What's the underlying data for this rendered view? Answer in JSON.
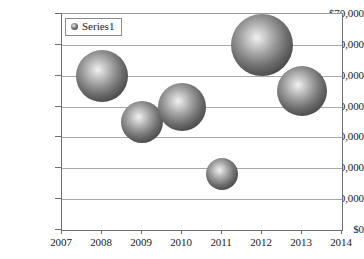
{
  "chart_data": {
    "type": "scatter",
    "subtype": "bubble",
    "title": "",
    "xlabel": "",
    "ylabel": "",
    "xlim": [
      2007,
      2014
    ],
    "ylim": [
      0,
      70000
    ],
    "grid": true,
    "legend_position": "top-left",
    "x_tick_labels": [
      "2007",
      "2008",
      "2009",
      "2010",
      "2011",
      "2012",
      "2013",
      "2014"
    ],
    "x_ticks": [
      2007,
      2008,
      2009,
      2010,
      2011,
      2012,
      2013,
      2014
    ],
    "y_tick_labels": [
      "$0",
      "$10,000",
      "$20,000",
      "$30,000",
      "$40,000",
      "$50,000",
      "$60,000",
      "$70,000"
    ],
    "y_ticks": [
      0,
      10000,
      20000,
      30000,
      40000,
      50000,
      60000,
      70000
    ],
    "series": [
      {
        "name": "Series1",
        "marker_style": "3d-sphere",
        "marker_color": "#4a4a4a",
        "points": [
          {
            "label": "2008",
            "x": 2008,
            "y": 50000,
            "size": 52
          },
          {
            "label": "2009",
            "x": 2009,
            "y": 35000,
            "size": 42
          },
          {
            "label": "2010",
            "x": 2010,
            "y": 40000,
            "size": 48
          },
          {
            "label": "2011",
            "x": 2011,
            "y": 18000,
            "size": 32
          },
          {
            "label": "2012",
            "x": 2012,
            "y": 60000,
            "size": 62
          },
          {
            "label": "2013",
            "x": 2013,
            "y": 45000,
            "size": 50
          }
        ]
      }
    ]
  },
  "legend": {
    "entries": [
      {
        "label": "Series1",
        "marker": "bubble-marker-icon"
      }
    ]
  },
  "colors": {
    "background": "#ffffff",
    "gridline": "#a8a8a8",
    "axis": "#6e6e6e",
    "text": "#1a1a1a",
    "bubble_edge": "#2c2c2c",
    "bubble_highlight": "#f2f2f2"
  }
}
